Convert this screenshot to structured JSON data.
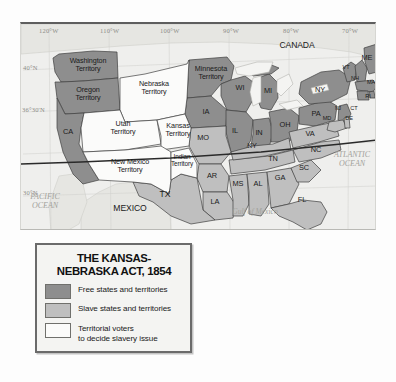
{
  "map": {
    "title": "The Kansas-Nebraska Act, 1854",
    "countries": [
      {
        "name": "CANADA",
        "x": 272,
        "y": 25
      },
      {
        "name": "MEXICO",
        "x": 108,
        "y": 186
      }
    ],
    "oceans": [
      {
        "name": "PACIFIC\nOCEAN",
        "line1": "PACIFIC",
        "line2": "OCEAN",
        "x": 16,
        "y": 175
      },
      {
        "name": "ATLANTIC\nOCEAN",
        "line1": "ATLANTIC",
        "line2": "OCEAN",
        "x": 318,
        "y": 133
      },
      {
        "name": "Gulf of Mexico",
        "line1": "Gulf of Mexico",
        "line2": "",
        "x": 228,
        "y": 190
      }
    ],
    "longitude_labels": [
      "120°W",
      "110°W",
      "100°W",
      "90°W",
      "80°W",
      "70°W"
    ],
    "latitude_labels": [
      "40°N",
      "36°30'N",
      "30°N"
    ],
    "free_areas": [
      {
        "label": "Washington\nTerritory",
        "line1": "Washington",
        "line2": "Territory"
      },
      {
        "label": "Oregon\nTerritory",
        "line1": "Oregon",
        "line2": "Territory"
      },
      {
        "label": "CA",
        "line1": "CA",
        "line2": ""
      },
      {
        "label": "Minnesota\nTerritory",
        "line1": "Minnesota",
        "line2": "Territory"
      },
      {
        "label": "WI",
        "line1": "WI",
        "line2": ""
      },
      {
        "label": "IA",
        "line1": "IA",
        "line2": ""
      },
      {
        "label": "IL",
        "line1": "IL",
        "line2": ""
      },
      {
        "label": "IN",
        "line1": "IN",
        "line2": ""
      },
      {
        "label": "MI",
        "line1": "MI",
        "line2": ""
      },
      {
        "label": "OH",
        "line1": "OH",
        "line2": ""
      },
      {
        "label": "PA",
        "line1": "PA",
        "line2": ""
      },
      {
        "label": "NY",
        "line1": "NY",
        "line2": ""
      },
      {
        "label": "VT",
        "line1": "VT",
        "line2": ""
      },
      {
        "label": "NH",
        "line1": "NH",
        "line2": ""
      },
      {
        "label": "ME",
        "line1": "ME",
        "line2": ""
      },
      {
        "label": "MA",
        "line1": "MA",
        "line2": ""
      },
      {
        "label": "RI",
        "line1": "RI",
        "line2": ""
      },
      {
        "label": "CT",
        "line1": "CT",
        "line2": ""
      },
      {
        "label": "NJ",
        "line1": "NJ",
        "line2": ""
      }
    ],
    "slave_areas": [
      {
        "label": "TX"
      },
      {
        "label": "AR"
      },
      {
        "label": "LA"
      },
      {
        "label": "MS"
      },
      {
        "label": "AL"
      },
      {
        "label": "GA"
      },
      {
        "label": "FL"
      },
      {
        "label": "SC"
      },
      {
        "label": "NC"
      },
      {
        "label": "TN"
      },
      {
        "label": "KY"
      },
      {
        "label": "MO"
      },
      {
        "label": "VA"
      },
      {
        "label": "MD"
      },
      {
        "label": "DE"
      }
    ],
    "vote_areas": [
      {
        "label": "Nebraska\nTerritory",
        "line1": "Nebraska",
        "line2": "Territory"
      },
      {
        "label": "Kansas\nTerritory",
        "line1": "Kansas",
        "line2": "Territory"
      },
      {
        "label": "Utah\nTerritory",
        "line1": "Utah",
        "line2": "Territory"
      },
      {
        "label": "New Mexico\nTerritory",
        "line1": "New Mexico",
        "line2": "Territory"
      },
      {
        "label": "Indian\nTerritory",
        "line1": "Indian",
        "line2": "Territory"
      }
    ]
  },
  "labels": {
    "canada": "CANADA",
    "mexico": "MEXICO",
    "pacific_1": "PACIFIC",
    "pacific_2": "OCEAN",
    "atlantic_1": "ATLANTIC",
    "atlantic_2": "OCEAN",
    "gulf": "Gulf of Mexico",
    "washington_1": "Washington",
    "washington_2": "Territory",
    "oregon_1": "Oregon",
    "oregon_2": "Territory",
    "ca": "CA",
    "utah_1": "Utah",
    "utah_2": "Territory",
    "newmexico_1": "New Mexico",
    "newmexico_2": "Territory",
    "nebraska_1": "Nebraska",
    "nebraska_2": "Territory",
    "minnesota_1": "Minnesota",
    "minnesota_2": "Territory",
    "kansas_1": "Kansas",
    "kansas_2": "Territory",
    "indian_1": "Indian",
    "indian_2": "Territory",
    "tx": "TX",
    "wi": "WI",
    "ia": "IA",
    "mo": "MO",
    "ar": "AR",
    "la": "LA",
    "ms": "MS",
    "al": "AL",
    "ga": "GA",
    "fl": "FL",
    "sc": "SC",
    "nc": "NC",
    "tn": "TN",
    "ky": "KY",
    "va": "VA",
    "il": "IL",
    "in": "IN",
    "mi": "MI",
    "oh": "OH",
    "pa": "PA",
    "ny": "NY",
    "vt": "VT",
    "nh": "NH",
    "me": "ME",
    "ma": "MA",
    "ri": "RI",
    "ct": "CT",
    "nj": "NJ",
    "md": "MD",
    "de": "DE",
    "lon_120": "120°W",
    "lon_110": "110°W",
    "lon_100": "100°W",
    "lon_90": "90°W",
    "lon_80": "80°W",
    "lon_70": "70°W",
    "lat_40": "40°N",
    "lat_3630": "36°30'N",
    "lat_30": "30°N"
  },
  "legend": {
    "title_line1": "THE KANSAS-",
    "title_line2": "NEBRASKA ACT, 1854",
    "items": [
      {
        "swatch": "free",
        "text_line1": "Free states and territories",
        "text_line2": "",
        "color": "#8e8e8e"
      },
      {
        "swatch": "slave",
        "text_line1": "Slave states and territories",
        "text_line2": "",
        "color": "#bfbfbf"
      },
      {
        "swatch": "vote",
        "text_line1": "Territorial voters",
        "text_line2": "to decide slavery issue",
        "color": "#fbfbfa"
      }
    ]
  },
  "colors": {
    "free": "#8e8e8e",
    "slave": "#bfbfbf",
    "vote": "#fbfbfa",
    "water": "#efefed",
    "land_outside": "#e4e4e0",
    "border": "#4a4a4a"
  }
}
